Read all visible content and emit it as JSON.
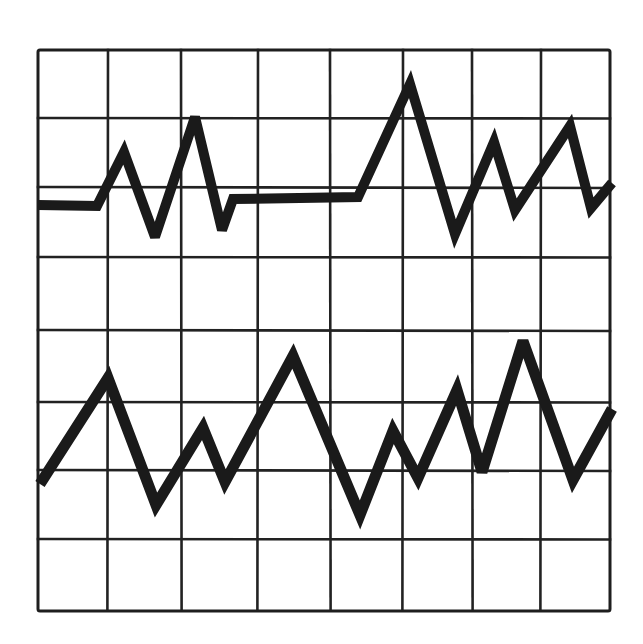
{
  "chart_data": {
    "type": "line",
    "title": "",
    "subtitle": "",
    "xlabel": "",
    "ylabel": "",
    "grid": true,
    "legend": null,
    "style": "hand-drawn strip-chart / oscilloscope trace on square grid",
    "colors": {
      "background": "#ffffff",
      "grid": "#222222",
      "trace": "#1a1a1a"
    },
    "grid_spec": {
      "columns": 8,
      "rows": 8,
      "x_lines_px": [
        38,
        108,
        181,
        258,
        330,
        403,
        472,
        541,
        610
      ],
      "y_lines_px": [
        50,
        118,
        187,
        257,
        330,
        402,
        470,
        539,
        610
      ]
    },
    "axis_ranges": {
      "x": [
        0,
        8
      ],
      "y": [
        0,
        8
      ]
    },
    "series": [
      {
        "name": "upper-trace",
        "stroke_width": 10,
        "points_px": [
          [
            38,
            205
          ],
          [
            97,
            206
          ],
          [
            124,
            152
          ],
          [
            155,
            237
          ],
          [
            195,
            117
          ],
          [
            222,
            230
          ],
          [
            233,
            199
          ],
          [
            358,
            197
          ],
          [
            410,
            84
          ],
          [
            455,
            234
          ],
          [
            494,
            142
          ],
          [
            515,
            210
          ],
          [
            570,
            126
          ],
          [
            591,
            208
          ],
          [
            612,
            183
          ]
        ],
        "points_grid": [
          [
            0.0,
            5.77
          ],
          [
            0.85,
            5.76
          ],
          [
            1.23,
            6.54
          ],
          [
            1.66,
            5.32
          ],
          [
            2.2,
            7.04
          ],
          [
            2.54,
            5.41
          ],
          [
            2.68,
            5.86
          ],
          [
            4.38,
            5.88
          ],
          [
            5.1,
            7.51
          ],
          [
            5.72,
            5.35
          ],
          [
            6.28,
            6.68
          ],
          [
            6.59,
            5.7
          ],
          [
            7.42,
            6.92
          ],
          [
            7.72,
            5.73
          ],
          [
            8.0,
            6.09
          ]
        ]
      },
      {
        "name": "lower-trace",
        "stroke_width": 11,
        "points_px": [
          [
            40,
            484
          ],
          [
            108,
            378
          ],
          [
            156,
            505
          ],
          [
            203,
            428
          ],
          [
            225,
            482
          ],
          [
            293,
            356
          ],
          [
            360,
            515
          ],
          [
            393,
            431
          ],
          [
            418,
            478
          ],
          [
            457,
            390
          ],
          [
            482,
            472
          ],
          [
            523,
            341
          ],
          [
            573,
            480
          ],
          [
            612,
            409
          ]
        ],
        "points_grid": [
          [
            0.03,
            1.72
          ],
          [
            1.0,
            3.24
          ],
          [
            1.65,
            1.41
          ],
          [
            2.29,
            2.52
          ],
          [
            2.57,
            1.74
          ],
          [
            3.48,
            3.56
          ],
          [
            4.41,
            1.26
          ],
          [
            4.89,
            2.48
          ],
          [
            5.23,
            1.8
          ],
          [
            5.79,
            3.07
          ],
          [
            6.15,
            1.89
          ],
          [
            6.73,
            3.78
          ],
          [
            7.44,
            1.77
          ],
          [
            8.0,
            2.79
          ]
        ]
      }
    ]
  }
}
